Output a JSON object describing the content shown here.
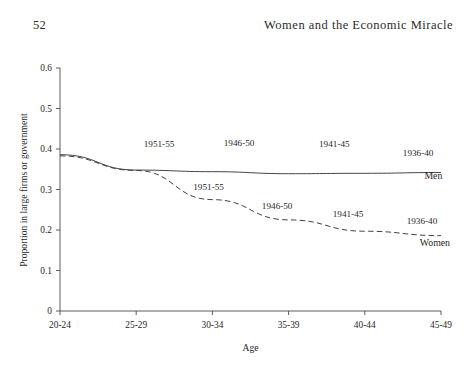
{
  "page": {
    "folio": "52",
    "running_head": "Women and the Economic Miracle"
  },
  "chart_data": {
    "type": "line",
    "title": "",
    "xlabel": "Age",
    "ylabel": "Proportion in large firms or government",
    "categories": [
      "20-24",
      "25-29",
      "30-34",
      "35-39",
      "40-44",
      "45-49"
    ],
    "ylim": [
      0,
      0.6
    ],
    "yticks": [
      "0",
      "0.1",
      "0.2",
      "0.3",
      "0.4",
      "0.5",
      "0.6"
    ],
    "ytick_values": [
      0,
      0.1,
      0.2,
      0.3,
      0.4,
      0.5,
      0.6
    ],
    "grid": false,
    "legend_position": "inline-annotations",
    "series": [
      {
        "name": "Men",
        "style": "solid",
        "x": [
          "20-24",
          "25-29",
          "30-34",
          "35-39",
          "40-44",
          "45-49"
        ],
        "values": [
          0.386,
          0.348,
          0.344,
          0.339,
          0.34,
          0.342
        ]
      },
      {
        "name": "Women",
        "style": "dashed",
        "x": [
          "20-24",
          "25-29",
          "30-34",
          "35-39",
          "40-44",
          "45-49"
        ],
        "values": [
          0.383,
          0.347,
          0.275,
          0.225,
          0.197,
          0.186
        ]
      }
    ],
    "annotations": [
      {
        "text": "1951-55",
        "series": "Men",
        "x_frac": 1.3,
        "value": 0.405
      },
      {
        "text": "1946-50",
        "series": "Men",
        "x_frac": 2.35,
        "value": 0.407
      },
      {
        "text": "1941-45",
        "series": "Men",
        "x_frac": 3.6,
        "value": 0.404
      },
      {
        "text": "1936-40",
        "series": "Men",
        "x_frac": 4.7,
        "value": 0.382
      },
      {
        "text": "Men",
        "series": "Men",
        "x_frac": 4.9,
        "value": 0.325
      },
      {
        "text": "1951-55",
        "series": "Women",
        "x_frac": 1.95,
        "value": 0.3
      },
      {
        "text": "1946-50",
        "series": "Women",
        "x_frac": 2.85,
        "value": 0.252
      },
      {
        "text": "1941-45",
        "series": "Women",
        "x_frac": 3.78,
        "value": 0.233
      },
      {
        "text": "1936-40",
        "series": "Women",
        "x_frac": 4.75,
        "value": 0.215
      },
      {
        "text": "Women",
        "series": "Women",
        "x_frac": 4.92,
        "value": 0.16
      }
    ]
  }
}
